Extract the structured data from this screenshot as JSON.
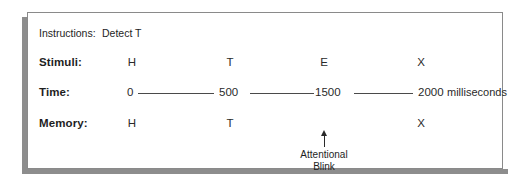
{
  "figure": {
    "caption_type": "attentional-blink-timeline-diagram"
  },
  "rows": {
    "instructions": {
      "label": "Instructions:",
      "value": "Detect T"
    },
    "stimuli": {
      "label": "Stimuli:",
      "items": [
        "H",
        "T",
        "E",
        "X"
      ]
    },
    "time": {
      "label": "Time:",
      "ticks": [
        "0",
        "500",
        "1500",
        "2000"
      ],
      "units": "milliseconds"
    },
    "memory": {
      "label": "Memory:",
      "items": [
        "H",
        "T",
        "",
        "X"
      ]
    }
  },
  "annotation": {
    "line1": "Attentional",
    "line2": "Blink",
    "arrow": "up-arrow-icon"
  },
  "colors": {
    "text": "#1e1e1e",
    "rule": "#4a4a4a",
    "border": "#8a8a8a",
    "shadow": "#8d8d8d",
    "background": "#ffffff"
  }
}
